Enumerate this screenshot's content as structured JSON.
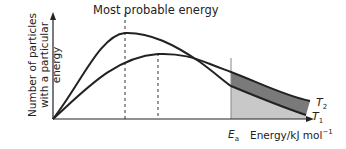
{
  "diagram": {
    "title": "Most probable energy",
    "y_axis_label_line1": "Number of particles",
    "y_axis_label_line2": "with a particular energy",
    "x_axis_label": "Energy/kJ mol",
    "x_axis_label_sup": "−1",
    "activation_energy_label": "E",
    "activation_energy_sub": "a",
    "curves": [
      {
        "name": "T",
        "sub": "1",
        "description": "lower temperature, higher and earlier peak"
      },
      {
        "name": "T",
        "sub": "2",
        "description": "higher temperature, lower and later peak"
      }
    ],
    "colors": {
      "line": "#222222",
      "shade_t1": "#c8c8c8",
      "shade_t2_extra": "#7a7a7a"
    }
  }
}
